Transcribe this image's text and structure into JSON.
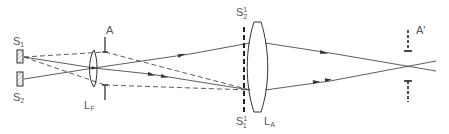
{
  "diagram": {
    "type": "optical-ray-diagram",
    "colors": {
      "line": "#333333",
      "label": "#555555",
      "hatch": "#777777"
    },
    "labels": {
      "source1": {
        "main": "S",
        "sub": "1"
      },
      "source2": {
        "main": "S",
        "sub": "2"
      },
      "field_lens": {
        "main": "L",
        "sub": "F"
      },
      "aperture": {
        "main": "A"
      },
      "image_s2": {
        "main": "S",
        "sub": "2",
        "sup": "1"
      },
      "image_s1": {
        "main": "S",
        "sub": "1",
        "sup": "1"
      },
      "lens_a": {
        "main": "L",
        "sub": "A"
      },
      "aperture_image": {
        "main": "A'"
      }
    }
  }
}
